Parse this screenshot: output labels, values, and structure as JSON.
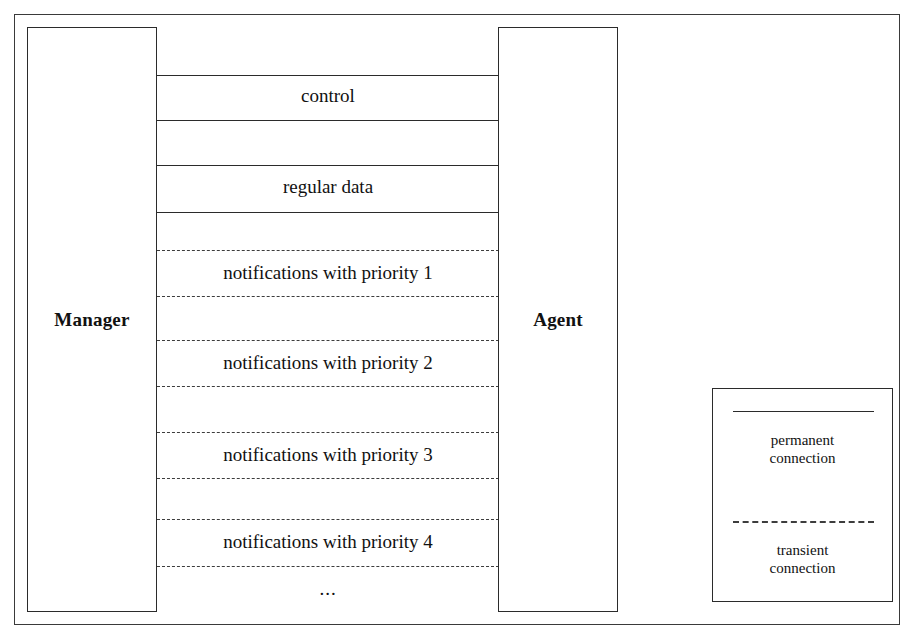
{
  "diagram": {
    "actors": [
      {
        "id": "manager",
        "label": "Manager"
      },
      {
        "id": "agent",
        "label": "Agent"
      }
    ],
    "permanent_channels": [
      {
        "label": "control"
      },
      {
        "label": "regular data"
      }
    ],
    "transient_channels": [
      {
        "label": "notifications with priority 1"
      },
      {
        "label": "notifications with priority 2"
      },
      {
        "label": "notifications with priority 3"
      },
      {
        "label": "notifications with priority 4"
      }
    ],
    "continuation": "...",
    "legend": {
      "permanent": {
        "line1": "permanent",
        "line2": "connection"
      },
      "transient": {
        "line1": "transient",
        "line2": "connection"
      }
    },
    "colors": {
      "background": "#ffffff",
      "stroke": "#2b2b2b",
      "dash_stroke": "#3d3d3d",
      "text": "#111111"
    }
  }
}
